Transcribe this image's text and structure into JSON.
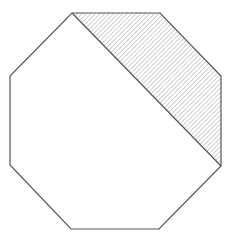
{
  "diagram": {
    "type": "regular-octagon-with-shaded-region",
    "width": 238,
    "height": 239,
    "colors": {
      "background": "#ffffff",
      "stroke": "#555555",
      "hatch": "#999999"
    },
    "octagon": {
      "vertices": [
        [
          72,
          13
        ],
        [
          160,
          13
        ],
        [
          221,
          76
        ],
        [
          221,
          166
        ],
        [
          159,
          229
        ],
        [
          71,
          229
        ],
        [
          10,
          165
        ],
        [
          10,
          76
        ]
      ]
    },
    "diagonal": {
      "from": [
        72,
        13
      ],
      "to": [
        221,
        166
      ]
    },
    "shaded_region": {
      "pattern": "diagonal-hatch",
      "vertices": [
        [
          72,
          13
        ],
        [
          160,
          13
        ],
        [
          221,
          76
        ],
        [
          221,
          166
        ]
      ]
    }
  }
}
